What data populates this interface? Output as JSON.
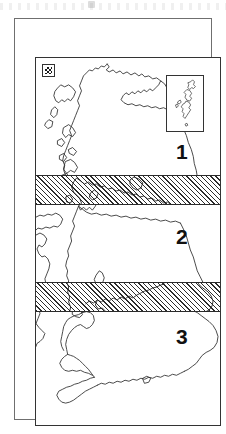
{
  "page": {
    "kind": "figure"
  },
  "map": {
    "title": "",
    "frame_label": "map-neatline",
    "key": {
      "swatch_name": "hatch-pattern-swatch",
      "fill": "diagonal-hatch",
      "color": "#1a1a1a"
    },
    "inset": {
      "name": "shetland-islands-inset",
      "label": ""
    },
    "zones": [
      {
        "id": "zone-1",
        "label": "1",
        "region": "north"
      },
      {
        "id": "zone-2",
        "label": "2",
        "region": "middle"
      },
      {
        "id": "zone-3",
        "label": "3",
        "region": "south"
      }
    ],
    "bands": [
      {
        "id": "band-north",
        "label": "",
        "fill": "diagonal-hatch"
      },
      {
        "id": "band-south",
        "label": "",
        "fill": "diagonal-hatch"
      }
    ],
    "colors": {
      "outline": "#333333",
      "hatch": "#2b2b2b",
      "background": "#ffffff",
      "outer_frame": "#6f6f6f",
      "label_text": "#111111"
    }
  }
}
